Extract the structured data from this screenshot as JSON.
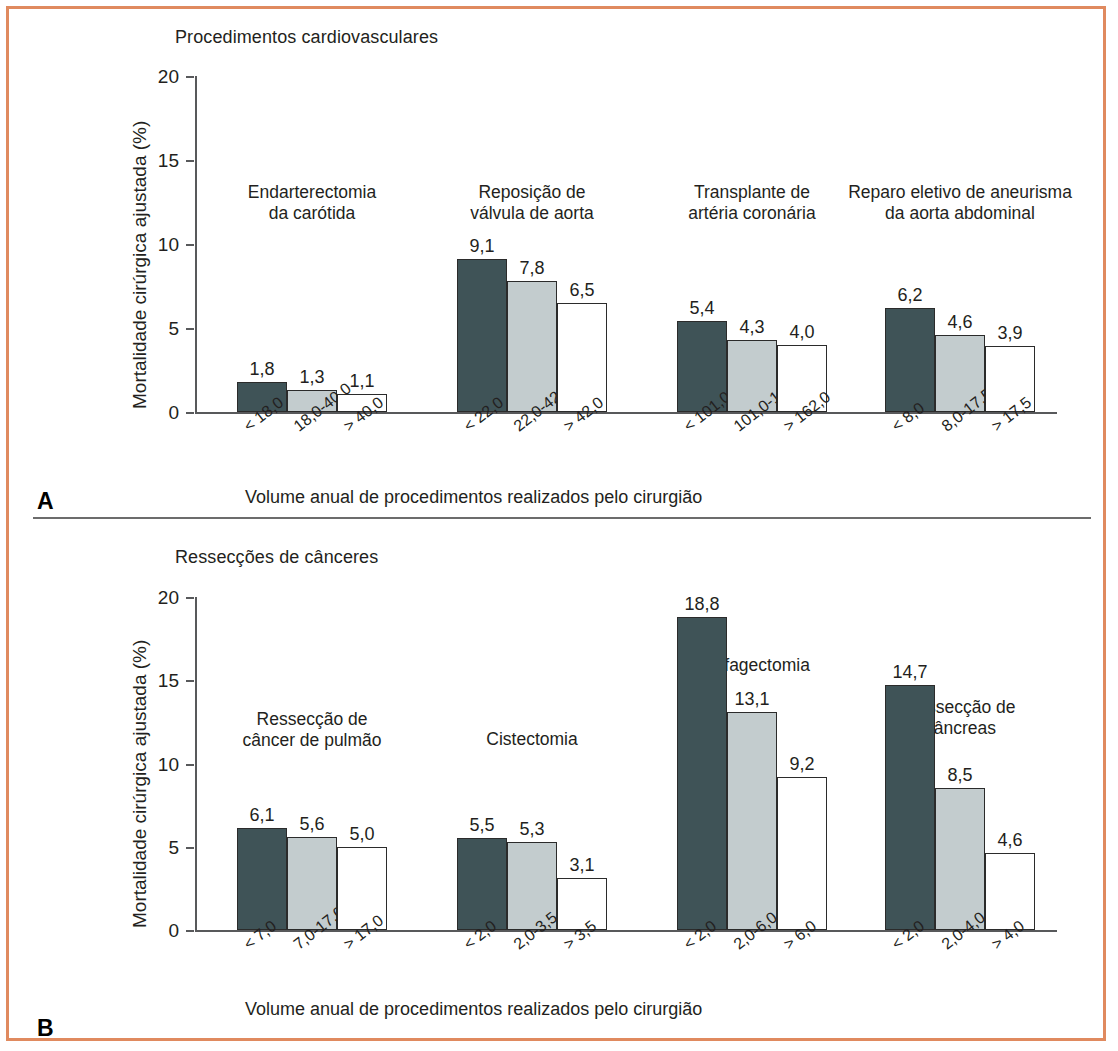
{
  "figure": {
    "border_color": "#e08a5f",
    "panels": [
      {
        "letter": "A",
        "title": "Procedimentos cardiovasculares",
        "y_axis_title": "Mortalidade cirúrgica ajustada (%)",
        "x_axis_title": "Volume anual de procedimentos realizados pelo cirurgião",
        "y_ticks": [
          "0",
          "5",
          "10",
          "15",
          "20"
        ]
      },
      {
        "letter": "B",
        "title": "Ressecções de cânceres",
        "y_axis_title": "Mortalidade cirúrgica ajustada (%)",
        "x_axis_title": "Volume anual de procedimentos realizados pelo cirurgião",
        "y_ticks": [
          "0",
          "5",
          "10",
          "15",
          "20"
        ]
      }
    ]
  },
  "colors": {
    "bar_dark": "#3f5357",
    "bar_mid": "#c3ccce",
    "bar_light": "#ffffff",
    "bar_stroke": "#2b2b2b",
    "axis": "#58595b",
    "frame": "#e08a5f"
  },
  "chart_data": [
    {
      "type": "bar",
      "title": "Procedimentos cardiovasculares",
      "panel": "A",
      "xlabel": "Volume anual de procedimentos realizados pelo cirurgião",
      "ylabel": "Mortalidade cirúrgica ajustada (%)",
      "ylim": [
        0,
        20
      ],
      "yticks": [
        0,
        5,
        10,
        15,
        20
      ],
      "grid": false,
      "legend": "none",
      "value_format": "comma-decimal",
      "groups": [
        {
          "name": "Endarterectomia\nda carótida",
          "categories": [
            "< 18,0",
            "18,0-40,0",
            "> 40,0"
          ],
          "values": [
            1.8,
            1.3,
            1.1
          ],
          "labels": [
            "1,8",
            "1,3",
            "1,1"
          ],
          "shades": [
            "dark",
            "mid",
            "light"
          ]
        },
        {
          "name": "Reposição de\nválvula de aorta",
          "categories": [
            "< 22,0",
            "22,0-42,0",
            "> 42,0"
          ],
          "values": [
            9.1,
            7.8,
            6.5
          ],
          "labels": [
            "9,1",
            "7,8",
            "6,5"
          ],
          "shades": [
            "dark",
            "mid",
            "light"
          ]
        },
        {
          "name": "Transplante de\nartéria coronária",
          "categories": [
            "< 101,0",
            "101,0-162,0",
            "> 162,0"
          ],
          "values": [
            5.4,
            4.3,
            4.0
          ],
          "labels": [
            "5,4",
            "4,3",
            "4,0"
          ],
          "shades": [
            "dark",
            "mid",
            "light"
          ]
        },
        {
          "name": "Reparo eletivo de aneurisma\nda aorta abdominal",
          "categories": [
            "< 8,0",
            "8,0-17,5",
            "> 17,5"
          ],
          "values": [
            6.2,
            4.6,
            3.9
          ],
          "labels": [
            "6,2",
            "4,6",
            "3,9"
          ],
          "shades": [
            "dark",
            "mid",
            "light"
          ]
        }
      ]
    },
    {
      "type": "bar",
      "title": "Ressecções de cânceres",
      "panel": "B",
      "xlabel": "Volume anual de procedimentos realizados pelo cirurgião",
      "ylabel": "Mortalidade cirúrgica ajustada (%)",
      "ylim": [
        0,
        20
      ],
      "yticks": [
        0,
        5,
        10,
        15,
        20
      ],
      "grid": false,
      "legend": "none",
      "value_format": "comma-decimal",
      "groups": [
        {
          "name": "Ressecção de\ncâncer de pulmão",
          "categories": [
            "< 7,0",
            "7,0-17,0",
            "> 17,0"
          ],
          "values": [
            6.1,
            5.6,
            5.0
          ],
          "labels": [
            "6,1",
            "5,6",
            "5,0"
          ],
          "shades": [
            "dark",
            "mid",
            "light"
          ]
        },
        {
          "name": "Cistectomia",
          "categories": [
            "< 2,0",
            "2,0-3,5",
            "> 3,5"
          ],
          "values": [
            5.5,
            5.3,
            3.1
          ],
          "labels": [
            "5,5",
            "5,3",
            "3,1"
          ],
          "shades": [
            "dark",
            "mid",
            "light"
          ]
        },
        {
          "name": "Esofagectomia",
          "categories": [
            "< 2,0",
            "2,0-6,0",
            "> 6,0"
          ],
          "values": [
            18.8,
            13.1,
            9.2
          ],
          "labels": [
            "18,8",
            "13,1",
            "9,2"
          ],
          "shades": [
            "dark",
            "mid",
            "light"
          ]
        },
        {
          "name": "Ressecção de\npâncreas",
          "categories": [
            "< 2,0",
            "2,0-4,0",
            "> 4,0"
          ],
          "values": [
            14.7,
            8.5,
            4.6
          ],
          "labels": [
            "14,7",
            "8,5",
            "4,6"
          ],
          "shades": [
            "dark",
            "mid",
            "light"
          ]
        }
      ]
    }
  ]
}
